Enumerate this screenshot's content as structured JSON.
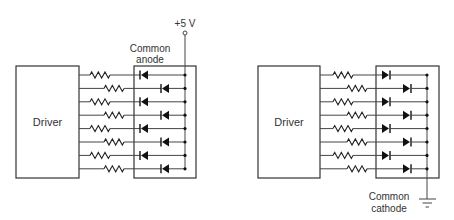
{
  "diagrams": [
    {
      "id": "common-anode",
      "driver_label": "Driver",
      "module_label_line1": "Common",
      "module_label_line2": "anode",
      "supply_label": "+5 V",
      "channels": 8,
      "diode_direction": "left"
    },
    {
      "id": "common-cathode",
      "driver_label": "Driver",
      "module_label_line1": "Common",
      "module_label_line2": "cathode",
      "supply_label": "ground",
      "channels": 8,
      "diode_direction": "right"
    }
  ],
  "colors": {
    "line": "#444444",
    "text": "#333333",
    "background": "#ffffff"
  }
}
